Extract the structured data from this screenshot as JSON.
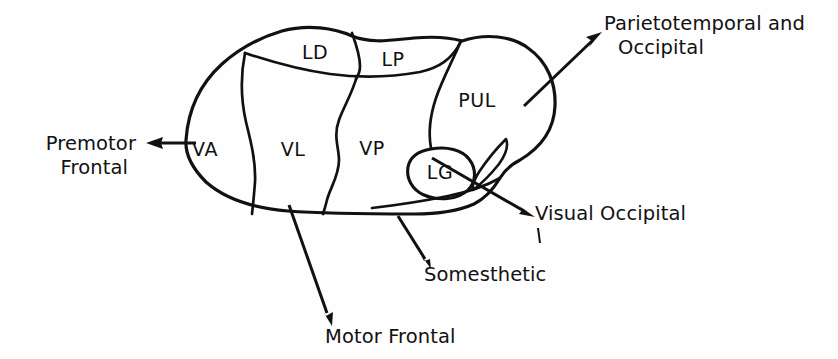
{
  "figure": {
    "type": "anatomical-diagram",
    "background_color": "#fefefe",
    "stroke_color": "#111111"
  },
  "nuclei": [
    {
      "id": "VA",
      "label": "VA",
      "x": 205,
      "y": 150
    },
    {
      "id": "VL",
      "label": "VL",
      "x": 281,
      "y": 150
    },
    {
      "id": "LD",
      "label": "LD",
      "x": 306,
      "y": 52
    },
    {
      "id": "LP",
      "label": "LP",
      "x": 389,
      "y": 59
    },
    {
      "id": "VP",
      "label": "VP",
      "x": 366,
      "y": 149
    },
    {
      "id": "PUL",
      "label": "PUL",
      "x": 467,
      "y": 101
    },
    {
      "id": "LG",
      "label": "LG",
      "x": 440,
      "y": 174
    }
  ],
  "callouts": [
    {
      "id": "premotor-frontal",
      "lines": [
        "Premotor",
        "Frontal"
      ],
      "align": "right",
      "x": 135,
      "y": 137,
      "line_height": 23,
      "arrow": {
        "from": [
          196,
          143
        ],
        "to": [
          147,
          143
        ]
      }
    },
    {
      "id": "parietotemporal-occipital",
      "lines": [
        "Parietotemporal and",
        "Occipital"
      ],
      "align": "left",
      "x": 604,
      "y": 30,
      "line_height": 23,
      "arrow": {
        "from": [
          524,
          106
        ],
        "to": [
          600,
          34
        ]
      }
    },
    {
      "id": "visual-occipital",
      "lines": [
        "Visual Occipital"
      ],
      "align": "left",
      "x": 535,
      "y": 219,
      "line_height": 23,
      "arrow": {
        "from": [
          432,
          158
        ],
        "to": [
          533,
          215
        ]
      }
    },
    {
      "id": "somesthetic",
      "lines": [
        "Somesthetic"
      ],
      "align": "left",
      "x": 424,
      "y": 280,
      "line_height": 23,
      "arrow": {
        "from": [
          400,
          218
        ],
        "to": [
          428,
          265
        ]
      }
    },
    {
      "id": "motor-frontal",
      "lines": [
        "Motor Frontal"
      ],
      "align": "left",
      "x": 325,
      "y": 341,
      "line_height": 23,
      "arrow": {
        "from": [
          291,
          207
        ],
        "to": [
          332,
          323
        ]
      }
    }
  ]
}
